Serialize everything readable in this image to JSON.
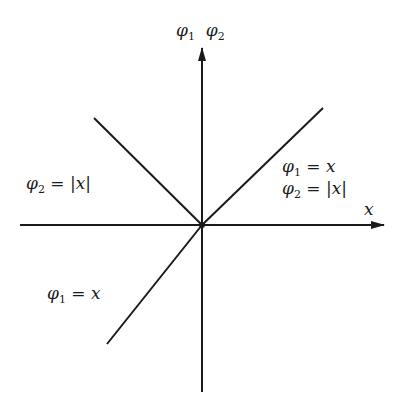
{
  "diagram": {
    "axis_labels": {
      "vertical_phi": "φ",
      "vertical_sub1": "1",
      "vertical_phi2": "φ",
      "vertical_sub2": "2",
      "horizontal": "x"
    },
    "annotations": {
      "upper_left": {
        "phi": "φ",
        "sub": "2",
        "rest": " = |x|"
      },
      "right_line1": {
        "phi": "φ",
        "sub": "1",
        "rest": " = x"
      },
      "right_line2": {
        "phi": "φ",
        "sub": "2",
        "rest": " = |x|"
      },
      "lower_left": {
        "phi": "φ",
        "sub": "1",
        "rest": " = x"
      }
    },
    "line_color": "#1a1a1a"
  }
}
